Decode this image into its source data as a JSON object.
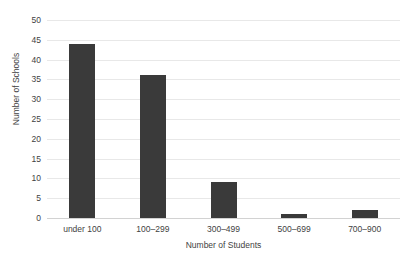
{
  "chart_data": {
    "type": "bar",
    "title": "",
    "categories": [
      "under 100",
      "100–299",
      "300–499",
      "500–699",
      "700–900"
    ],
    "values": [
      44,
      36,
      9,
      1,
      2
    ],
    "xlabel": "Number of Students",
    "ylabel": "Number of Schools",
    "ylim": [
      0,
      50
    ],
    "ytick_step": 5,
    "yticks": [
      50,
      45,
      40,
      35,
      30,
      25,
      20,
      15,
      10,
      5,
      0
    ],
    "ytick_labels": [
      "50",
      "45",
      "40",
      "35",
      "30",
      "25",
      "20",
      "15",
      "10",
      "5",
      "0"
    ],
    "grid": true,
    "grid_axis": "y",
    "legend": false,
    "bar_color": "#3a3a3a",
    "gridline_color": "#e8e8e8",
    "text_color": "#3f3f3f",
    "background": "#ffffff"
  }
}
